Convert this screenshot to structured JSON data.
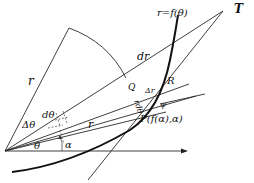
{
  "diagram": {
    "labels": {
      "curve_equation": "r=f(θ)",
      "tangent_point": "T",
      "radius_outer": "r",
      "radius_inner": "r",
      "dr": "dr",
      "R": "R",
      "Q": "Q",
      "delta_r": "Δr",
      "r_dtheta": "rdθ",
      "psi": "ψ",
      "point_P": "P(f(α),α)",
      "dtheta": "dθ",
      "delta_theta": "Δθ",
      "theta": "θ",
      "alpha": "α"
    },
    "colors": {
      "line": "#2a2a2a",
      "curve": "#111111",
      "background": "#ffffff"
    }
  }
}
